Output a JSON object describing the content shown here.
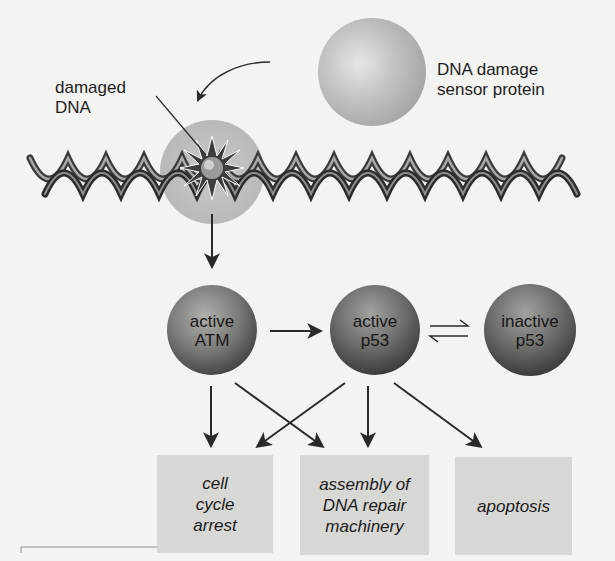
{
  "figure": {
    "type": "pathway-diagram",
    "nodes": {
      "sensor": {
        "label": "DNA damage\nsensor protein"
      },
      "damaged_dna": {
        "label": "damaged\nDNA"
      },
      "atm": {
        "label": "active\nATM"
      },
      "p53_active": {
        "label": "active\np53"
      },
      "p53_inactive": {
        "label": "inactive\np53"
      }
    },
    "outcomes": [
      {
        "label": "cell\ncycle\narrest"
      },
      {
        "label": "assembly of\nDNA repair\nmachinery"
      },
      {
        "label": "apoptosis"
      }
    ],
    "edges": [
      {
        "from": "sensor",
        "to": "damaged_dna",
        "style": "curved-arrow"
      },
      {
        "from": "damaged_dna",
        "to": "atm"
      },
      {
        "from": "atm",
        "to": "p53_active"
      },
      {
        "from": "p53_active",
        "to": "p53_inactive",
        "style": "reversible"
      },
      {
        "from": "atm",
        "to": "cell cycle arrest"
      },
      {
        "from": "atm",
        "to": "assembly of DNA repair machinery"
      },
      {
        "from": "p53_active",
        "to": "cell cycle arrest"
      },
      {
        "from": "p53_active",
        "to": "assembly of DNA repair machinery"
      },
      {
        "from": "p53_active",
        "to": "apoptosis"
      }
    ]
  },
  "colors": {
    "background": "#f3f3f1",
    "sensor_sphere": "#b8b8b6",
    "node_sphere": "#6e6e6c",
    "outcome_box": "#d7d7d5",
    "arrow": "#2a2a2a"
  }
}
